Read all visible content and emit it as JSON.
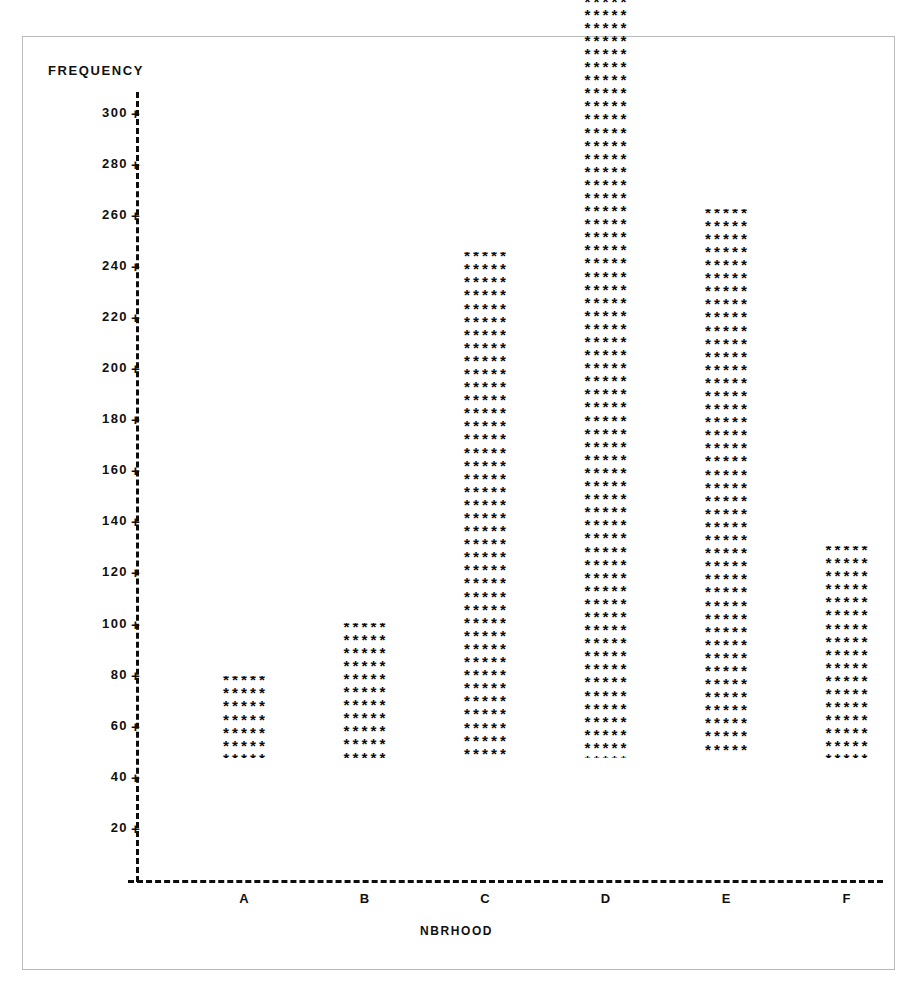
{
  "chart_data": {
    "type": "bar",
    "title": "",
    "subtitle": "",
    "xlabel": "NBRHOOD",
    "ylabel": "FREQUENCY",
    "categories": [
      "A",
      "B",
      "C",
      "D",
      "E",
      "F"
    ],
    "values": [
      32,
      53,
      198,
      313,
      215,
      83
    ],
    "series": [
      {
        "name": "FREQUENCY",
        "values": [
          32,
          53,
          198,
          313,
          215,
          83
        ]
      }
    ],
    "ylim": [
      0,
      320
    ],
    "xlim": [
      0,
      6
    ],
    "y_ticks": [
      20,
      40,
      60,
      80,
      100,
      120,
      140,
      160,
      180,
      200,
      220,
      240,
      260,
      280,
      300
    ],
    "y_tick_labels": [
      "20",
      "40",
      "60",
      "80",
      "100",
      "120",
      "140",
      "160",
      "180",
      "200",
      "220",
      "240",
      "260",
      "280",
      "300"
    ],
    "grid": false,
    "legend": false,
    "legend_position": "none",
    "marker_glyph": "*****"
  },
  "chart": {
    "y_axis_title": "FREQUENCY",
    "x_axis_title": "NBRHOOD",
    "tick_mark_glyph": "+",
    "bar_fill_row": "*****",
    "colors": {
      "ink": "#0b0b0b",
      "frame": "#b9b9b9",
      "background": "#ffffff"
    }
  }
}
